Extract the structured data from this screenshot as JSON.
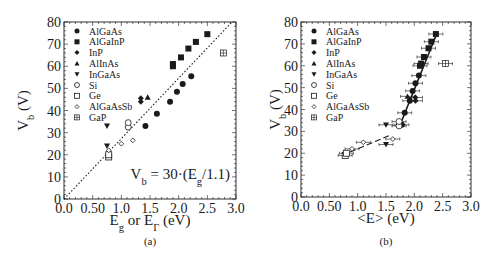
{
  "chart_data": [
    {
      "type": "scatter",
      "panel_label": "(a)",
      "xlabel": "E_g or E_Γ (eV)",
      "ylabel": "V_b (V)",
      "xlim": [
        0.0,
        3.0
      ],
      "ylim": [
        0,
        80
      ],
      "xticks": [
        "0.0",
        "0.50",
        "1.0",
        "1.5",
        "2.0",
        "2.5",
        "3.0"
      ],
      "yticks": [
        "0",
        "10",
        "20",
        "30",
        "40",
        "50",
        "60",
        "70",
        "80"
      ],
      "grid": false,
      "legend_position": "upper-left",
      "annotation": "V_b = 30·(E_g/1.1)",
      "fit_line": {
        "style": "dotted",
        "x": [
          0,
          2.93
        ],
        "y": [
          0,
          80
        ]
      },
      "series": [
        {
          "name": "AlGaAs",
          "marker": "filled-circle",
          "points": [
            [
              1.42,
              33
            ],
            [
              1.62,
              38.5
            ],
            [
              1.85,
              44
            ],
            [
              1.97,
              48.5
            ],
            [
              2.07,
              52
            ],
            [
              2.22,
              55.5
            ]
          ]
        },
        {
          "name": "AlGaInP",
          "marker": "filled-square",
          "points": [
            [
              1.9,
              60
            ],
            [
              1.9,
              61
            ],
            [
              2.04,
              64
            ],
            [
              2.17,
              68
            ],
            [
              2.3,
              71
            ],
            [
              2.5,
              74.5
            ]
          ]
        },
        {
          "name": "InP",
          "marker": "filled-diamond",
          "points": [
            [
              1.34,
              44
            ],
            [
              1.34,
              45.5
            ]
          ]
        },
        {
          "name": "AlInAs",
          "marker": "filled-triangle-up",
          "points": [
            [
              1.46,
              46
            ]
          ]
        },
        {
          "name": "InGaAs",
          "marker": "filled-triangle-down",
          "points": [
            [
              0.75,
              33
            ],
            [
              0.75,
              24
            ]
          ]
        },
        {
          "name": "Si",
          "marker": "open-circle",
          "points": [
            [
              1.12,
              32.5
            ],
            [
              1.12,
              34.5
            ]
          ]
        },
        {
          "name": "Ge",
          "marker": "open-square",
          "points": [
            [
              0.78,
              19
            ],
            [
              0.78,
              20
            ]
          ]
        },
        {
          "name": "AlGaAsSb",
          "marker": "open-diamond",
          "points": [
            [
              0.78,
              22
            ],
            [
              1.0,
              25
            ],
            [
              1.2,
              26.5
            ]
          ]
        },
        {
          "name": "GaP",
          "marker": "crossed-square",
          "points": [
            [
              2.78,
              66
            ]
          ]
        }
      ]
    },
    {
      "type": "scatter",
      "panel_label": "(b)",
      "xlabel": "<E> (eV)",
      "ylabel": "V_b (V)",
      "xlim": [
        0.0,
        3.0
      ],
      "ylim": [
        0,
        80
      ],
      "xticks": [
        "0.0",
        "0.50",
        "1.0",
        "1.5",
        "2.0",
        "2.5",
        "3.0"
      ],
      "yticks": [
        "0",
        "10",
        "20",
        "30",
        "40",
        "50",
        "60",
        "70",
        "80"
      ],
      "grid": false,
      "legend_position": "upper-left",
      "error_bars": "horizontal",
      "fit_lines": [
        {
          "style": "solid",
          "x": [
            1.75,
            2.4
          ],
          "y": [
            33,
            75
          ]
        },
        {
          "style": "dashed",
          "x": [
            0.72,
            1.55
          ],
          "y": [
            19,
            28
          ]
        }
      ],
      "series": [
        {
          "name": "AlGaAs",
          "marker": "filled-circle",
          "points": [
            [
              1.78,
              33
            ],
            [
              1.83,
              38.5
            ],
            [
              1.92,
              44
            ],
            [
              1.97,
              48.5
            ],
            [
              2.02,
              52
            ],
            [
              2.08,
              55.5
            ]
          ]
        },
        {
          "name": "AlGaInP",
          "marker": "filled-square",
          "points": [
            [
              2.1,
              60
            ],
            [
              2.12,
              61
            ],
            [
              2.17,
              64
            ],
            [
              2.25,
              68
            ],
            [
              2.3,
              71
            ],
            [
              2.38,
              74.5
            ]
          ]
        },
        {
          "name": "InP",
          "marker": "filled-diamond",
          "points": [
            [
              2.02,
              44
            ],
            [
              2.02,
              45.5
            ]
          ]
        },
        {
          "name": "AlInAs",
          "marker": "filled-triangle-up",
          "points": [
            [
              1.88,
              46
            ]
          ]
        },
        {
          "name": "InGaAs",
          "marker": "filled-triangle-down",
          "points": [
            [
              1.5,
              33
            ],
            [
              1.5,
              24
            ]
          ]
        },
        {
          "name": "Si",
          "marker": "open-circle",
          "points": [
            [
              1.73,
              32.5
            ],
            [
              1.73,
              34.5
            ]
          ]
        },
        {
          "name": "Ge",
          "marker": "open-square",
          "points": [
            [
              0.78,
              19
            ],
            [
              0.8,
              20
            ]
          ]
        },
        {
          "name": "AlGaAsSb",
          "marker": "open-diamond",
          "points": [
            [
              0.9,
              22
            ],
            [
              1.1,
              25
            ],
            [
              1.62,
              26.5
            ]
          ]
        },
        {
          "name": "GaP",
          "marker": "crossed-square",
          "points": [
            [
              2.55,
              61
            ]
          ]
        }
      ]
    }
  ]
}
